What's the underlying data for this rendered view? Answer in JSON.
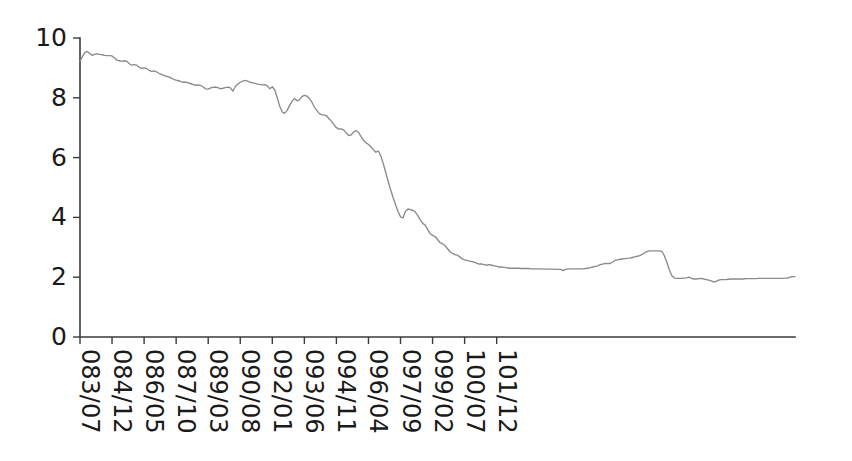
{
  "chart_data": {
    "type": "line",
    "title": "",
    "subtitle": "",
    "xlabel": "",
    "ylabel": "",
    "xlim": [
      0,
      174
    ],
    "ylim": [
      0,
      10
    ],
    "grid": false,
    "legend": null,
    "line_color": "#8a8a8a",
    "axis_color": "#3b3b3b",
    "background": "#ffffff",
    "y_ticks": [
      0,
      2,
      4,
      6,
      8,
      10
    ],
    "y_tick_labels": [
      "0",
      "2",
      "4",
      "6",
      "8",
      "10"
    ],
    "x_tick_labels": [
      "083/07",
      "084/12",
      "086/05",
      "087/10",
      "089/03",
      "090/08",
      "092/01",
      "093/06",
      "094/11",
      "096/04",
      "097/09",
      "099/02",
      "100/07",
      "101/12"
    ],
    "x_tick_indices": [
      0,
      13,
      26,
      39,
      52,
      65,
      78,
      91,
      104,
      117,
      130,
      143,
      156,
      169
    ],
    "series": [
      {
        "name": "value",
        "values": [
          9.22,
          9.38,
          9.52,
          9.55,
          9.48,
          9.42,
          9.46,
          9.47,
          9.45,
          9.44,
          9.42,
          9.41,
          9.41,
          9.4,
          9.33,
          9.26,
          9.24,
          9.22,
          9.24,
          9.22,
          9.14,
          9.09,
          9.11,
          9.09,
          9.02,
          8.98,
          9.0,
          8.98,
          8.92,
          8.88,
          8.9,
          8.87,
          8.82,
          8.78,
          8.75,
          8.72,
          8.7,
          8.66,
          8.62,
          8.59,
          8.57,
          8.54,
          8.52,
          8.52,
          8.5,
          8.47,
          8.44,
          8.42,
          8.43,
          8.41,
          8.36,
          8.3,
          8.29,
          8.33,
          8.35,
          8.36,
          8.34,
          8.3,
          8.32,
          8.34,
          8.36,
          8.33,
          8.22,
          8.38,
          8.45,
          8.52,
          8.56,
          8.58,
          8.56,
          8.52,
          8.5,
          8.48,
          8.46,
          8.45,
          8.43,
          8.44,
          8.4,
          8.3,
          8.37,
          8.26,
          8.0,
          7.72,
          7.53,
          7.48,
          7.58,
          7.74,
          7.88,
          7.98,
          7.9,
          7.94,
          8.04,
          8.08,
          8.06,
          7.98,
          7.86,
          7.7,
          7.58,
          7.48,
          7.44,
          7.42,
          7.4,
          7.3,
          7.22,
          7.1,
          7.0,
          6.95,
          6.96,
          6.92,
          6.82,
          6.74,
          6.76,
          6.86,
          6.9,
          6.84,
          6.7,
          6.58,
          6.5,
          6.44,
          6.36,
          6.26,
          6.18,
          6.22,
          6.06,
          5.8,
          5.5,
          5.2,
          4.92,
          4.66,
          4.42,
          4.2,
          4.02,
          3.98,
          4.2,
          4.28,
          4.26,
          4.24,
          4.18,
          4.06,
          3.92,
          3.8,
          3.74,
          3.6,
          3.46,
          3.4,
          3.36,
          3.26,
          3.16,
          3.12,
          3.06,
          2.96,
          2.86,
          2.8,
          2.76,
          2.74,
          2.68,
          2.62,
          2.58,
          2.56,
          2.54,
          2.52,
          2.5,
          2.46,
          2.44,
          2.44,
          2.42,
          2.4,
          2.42,
          2.4,
          2.38,
          2.36,
          2.34,
          2.34,
          2.33,
          2.32,
          2.3,
          2.3,
          2.3,
          2.3,
          2.3,
          2.29,
          2.29,
          2.29,
          2.29,
          2.28,
          2.28,
          2.28,
          2.28,
          2.28,
          2.27,
          2.27,
          2.27,
          2.27,
          2.27,
          2.26,
          2.26,
          2.26,
          2.22,
          2.26,
          2.28,
          2.28,
          2.28,
          2.28,
          2.28,
          2.28,
          2.28,
          2.29,
          2.3,
          2.32,
          2.34,
          2.36,
          2.38,
          2.42,
          2.44,
          2.46,
          2.46,
          2.46,
          2.5,
          2.56,
          2.58,
          2.6,
          2.61,
          2.62,
          2.63,
          2.64,
          2.66,
          2.68,
          2.7,
          2.72,
          2.76,
          2.82,
          2.86,
          2.88,
          2.88,
          2.88,
          2.88,
          2.88,
          2.86,
          2.72,
          2.5,
          2.26,
          2.06,
          1.98,
          1.96,
          1.96,
          1.96,
          1.97,
          1.98,
          2.0,
          1.96,
          1.94,
          1.94,
          1.95,
          1.96,
          1.94,
          1.92,
          1.9,
          1.88,
          1.84,
          1.86,
          1.9,
          1.92,
          1.92,
          1.92,
          1.93,
          1.94,
          1.94,
          1.94,
          1.94,
          1.94,
          1.94,
          1.95,
          1.95,
          1.95,
          1.95,
          1.95,
          1.96,
          1.96,
          1.96,
          1.96,
          1.96,
          1.96,
          1.96,
          1.96,
          1.96,
          1.96,
          1.96,
          1.97,
          1.97,
          2.0,
          2.02,
          2.02
        ]
      }
    ]
  },
  "geometry": {
    "plot_left": 80,
    "plot_right": 795,
    "plot_top": 38,
    "plot_bottom": 337,
    "tick_len": 7,
    "x_label_offset": 12
  }
}
